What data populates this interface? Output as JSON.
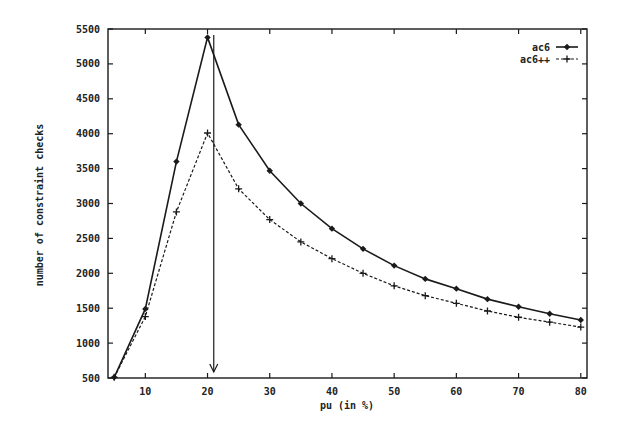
{
  "chart_data": {
    "type": "line",
    "title": "",
    "xlabel": "pu (in %)",
    "ylabel": "number of constraint checks",
    "xlim": [
      4,
      81
    ],
    "ylim": [
      500,
      5500
    ],
    "x_ticks": [
      10,
      20,
      30,
      40,
      50,
      60,
      70,
      80
    ],
    "y_ticks": [
      500,
      1000,
      1500,
      2000,
      2500,
      3000,
      3500,
      4000,
      4500,
      5000,
      5500
    ],
    "grid": false,
    "legend_position": "top-right",
    "x": [
      5,
      10,
      15,
      20,
      25,
      30,
      35,
      40,
      45,
      50,
      55,
      60,
      65,
      70,
      75,
      80
    ],
    "series": [
      {
        "name": "ac6",
        "style": "solid",
        "marker": "diamond",
        "values": [
          510,
          1490,
          3600,
          5380,
          4130,
          3470,
          3000,
          2640,
          2350,
          2110,
          1920,
          1780,
          1630,
          1520,
          1420,
          1330
        ]
      },
      {
        "name": "ac6++",
        "style": "dashed",
        "marker": "plus",
        "values": [
          510,
          1380,
          2880,
          4010,
          3210,
          2770,
          2450,
          2210,
          2000,
          1820,
          1680,
          1570,
          1460,
          1370,
          1300,
          1230
        ]
      }
    ],
    "annotations": [
      {
        "type": "arrow",
        "x": 21,
        "y_from": 5500,
        "y_to": 500,
        "direction": "down"
      }
    ]
  },
  "legend": {
    "items": [
      {
        "label": "ac6"
      },
      {
        "label": "ac6++"
      }
    ]
  }
}
